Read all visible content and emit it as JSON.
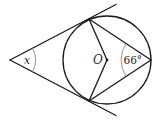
{
  "diagram": {
    "type": "geometry",
    "labels": {
      "angle_x": "x",
      "center": "O",
      "inscribed_angle": "66°"
    },
    "points": {
      "external_point": [
        10,
        60
      ],
      "tangent_point_upper": [
        89,
        19
      ],
      "tangent_point_lower": [
        89,
        101
      ],
      "center_O": [
        107,
        60
      ],
      "circle_point_right": [
        151,
        60
      ]
    },
    "circle": {
      "cx": 107,
      "cy": 60,
      "r": 44
    },
    "colors": {
      "line": "#1a1a1a",
      "angle_arc": "#7a7a7a",
      "background": "#ffffff"
    }
  }
}
